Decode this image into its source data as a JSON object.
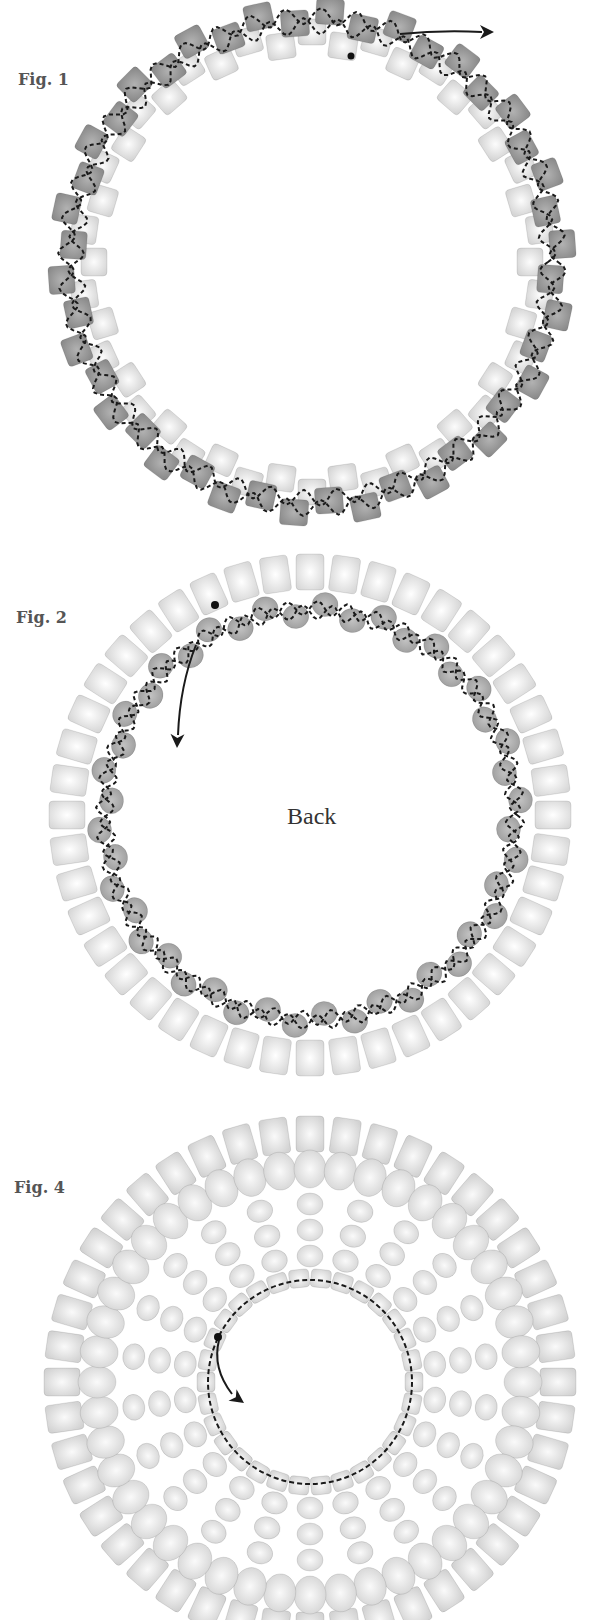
{
  "figures": [
    {
      "id": "fig1",
      "label": "Fig. 1",
      "description": "Ring of cube beads: dark outer row and light inner row, thread path shown with dashed lines",
      "outer_bead_count": 44,
      "inner_bead_count": 44,
      "colors": {
        "dark_bead": "#8a8a8a",
        "light_bead": "#d4d4d4",
        "thread": "#1a1a1a"
      },
      "annotations": [
        "thread start dot",
        "exit arrow"
      ]
    },
    {
      "id": "fig2",
      "label": "Fig. 2",
      "center_text": "Back",
      "description": "Back side of ring: light outer cube beads with darker round beads stitched along the inner edge",
      "outer_bead_count": 44,
      "round_bead_count": 44,
      "colors": {
        "cube_bead": "#d8d8d8",
        "round_bead": "#9a9a9a",
        "thread": "#1a1a1a"
      },
      "annotations": [
        "thread start dot",
        "direction arrow"
      ]
    },
    {
      "id": "fig4",
      "label": "Fig. 4",
      "description": "Completed component: outer cube ring, round bead spokes, and inner cube ring with dashed thread path",
      "outer_bead_count": 44,
      "spoke_count": 22,
      "inner_bead_count": 30,
      "colors": {
        "bead": "#d2d2d2",
        "bead_edge": "#b4b4b4",
        "thread": "#1a1a1a"
      },
      "annotations": [
        "thread start dot",
        "direction arrow"
      ]
    }
  ]
}
